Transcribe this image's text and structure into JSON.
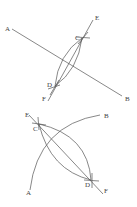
{
  "figure1": {
    "labels": {
      "A": "A",
      "B": "B",
      "C": "C",
      "D": "D",
      "E": "E",
      "F": "F"
    }
  },
  "figure2": {
    "labels": {
      "A": "A",
      "B": "B",
      "C": "C",
      "D": "D",
      "E": "E",
      "F": "F"
    }
  },
  "colors": {
    "stroke": "#555555",
    "text": "#444444"
  }
}
